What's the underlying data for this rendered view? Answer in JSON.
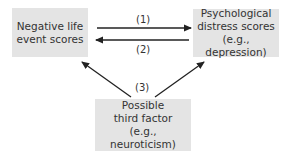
{
  "nodes": {
    "negative": {
      "lines": [
        "Negative life",
        "event scores"
      ]
    },
    "distress": {
      "lines": [
        "Psychological",
        "distress scores",
        "(e.g., depression)"
      ]
    },
    "third": {
      "lines": [
        "Possible",
        "third factor",
        "(e.g., neuroticism)"
      ]
    }
  },
  "edges": {
    "e1": {
      "label": "(1)",
      "from": "negative",
      "to": "distress"
    },
    "e2": {
      "label": "(2)",
      "from": "distress",
      "to": "negative"
    },
    "e3": {
      "label": "(3)",
      "from": "third",
      "to": "negative and distress"
    }
  },
  "colors": {
    "box_fill": "#e4e4e4",
    "arrow": "#222222",
    "text": "#333333"
  }
}
